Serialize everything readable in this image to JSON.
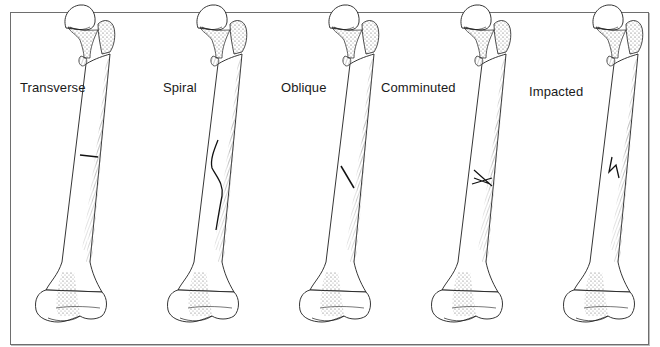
{
  "figure": {
    "border_color": "#6e6e6e",
    "ink_color": "#1f1f1f",
    "fracture_color": "#111111",
    "panels": [
      {
        "label": "Transverse",
        "label_x": 20,
        "label_y": 80,
        "bone_x": 18,
        "fracture": "transverse"
      },
      {
        "label": "Spiral",
        "label_x": 163,
        "label_y": 80,
        "bone_x": 150,
        "fracture": "spiral"
      },
      {
        "label": "Oblique",
        "label_x": 281,
        "label_y": 80,
        "bone_x": 282,
        "fracture": "oblique"
      },
      {
        "label": "Comminuted",
        "label_x": 381,
        "label_y": 80,
        "bone_x": 414,
        "fracture": "comminuted"
      },
      {
        "label": "Impacted",
        "label_x": 529,
        "label_y": 84,
        "bone_x": 546,
        "fracture": "impacted"
      }
    ]
  }
}
